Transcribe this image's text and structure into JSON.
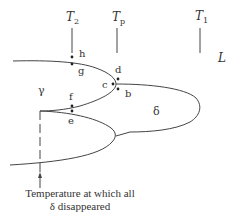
{
  "diagram": {
    "temperature_markers": [
      {
        "label_main": "T",
        "label_sub": "2",
        "x": 72
      },
      {
        "label_main": "T",
        "label_sub": "p",
        "x": 117
      },
      {
        "label_main": "T",
        "label_sub": "1",
        "x": 200
      }
    ],
    "phase_labels": {
      "liquid": "L",
      "gamma": "γ",
      "delta": "δ"
    },
    "points": [
      {
        "name": "h",
        "x": 72,
        "y": 57
      },
      {
        "name": "g",
        "x": 72,
        "y": 64
      },
      {
        "name": "d",
        "x": 118,
        "y": 79
      },
      {
        "name": "c",
        "x": 113,
        "y": 84
      },
      {
        "name": "b",
        "x": 118,
        "y": 89
      },
      {
        "name": "f",
        "x": 72,
        "y": 106
      },
      {
        "name": "e",
        "x": 72,
        "y": 111
      }
    ],
    "caption_line1": "Temperature at which all",
    "caption_line2": "δ disappeared"
  }
}
